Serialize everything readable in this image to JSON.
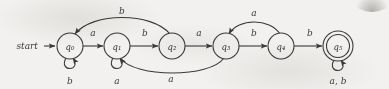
{
  "figure": {
    "kind": "finite-automaton-state-diagram",
    "start_label": "start",
    "stroke_color": "#3a3a3c",
    "background_color": "#f2f1ef"
  },
  "states": [
    {
      "id": "q0",
      "label": "q₀",
      "accepting": false,
      "start": true,
      "cx": 70,
      "cy": 46
    },
    {
      "id": "q1",
      "label": "q₁",
      "accepting": false,
      "start": false,
      "cx": 117,
      "cy": 46
    },
    {
      "id": "q2",
      "label": "q₂",
      "accepting": false,
      "start": false,
      "cx": 172,
      "cy": 46
    },
    {
      "id": "q3",
      "label": "q₃",
      "accepting": false,
      "start": false,
      "cx": 226,
      "cy": 46
    },
    {
      "id": "q4",
      "label": "q₄",
      "accepting": false,
      "start": false,
      "cx": 281,
      "cy": 46
    },
    {
      "id": "q5",
      "label": "q₅",
      "accepting": true,
      "start": false,
      "cx": 338,
      "cy": 46
    }
  ],
  "transitions": [
    {
      "id": "t-q0-q1",
      "from": "q0",
      "to": "q1",
      "symbol": "a",
      "shape": "straight",
      "label_x": 93,
      "label_y": 36
    },
    {
      "id": "t-q1-q2",
      "from": "q1",
      "to": "q2",
      "symbol": "b",
      "shape": "straight",
      "label_x": 145,
      "label_y": 36
    },
    {
      "id": "t-q2-q3",
      "from": "q2",
      "to": "q3",
      "symbol": "a",
      "shape": "straight",
      "label_x": 199,
      "label_y": 36
    },
    {
      "id": "t-q3-q4",
      "from": "q3",
      "to": "q4",
      "symbol": "b",
      "shape": "straight",
      "label_x": 254,
      "label_y": 36
    },
    {
      "id": "t-q4-q5",
      "from": "q4",
      "to": "q5",
      "symbol": "b",
      "shape": "straight",
      "label_x": 310,
      "label_y": 36
    },
    {
      "id": "t-q2-q0",
      "from": "q2",
      "to": "q0",
      "symbol": "b",
      "shape": "arc-above",
      "label_x": 122,
      "label_y": 14
    },
    {
      "id": "t-q4-q3",
      "from": "q4",
      "to": "q3",
      "symbol": "a",
      "shape": "arc-above",
      "label_x": 254,
      "label_y": 16
    },
    {
      "id": "t-q3-q1",
      "from": "q3",
      "to": "q1",
      "symbol": "a",
      "shape": "arc-below",
      "label_x": 171,
      "label_y": 82
    },
    {
      "id": "t-q0-q0",
      "from": "q0",
      "to": "q0",
      "symbol": "b",
      "shape": "self-loop",
      "label_x": 70,
      "label_y": 84
    },
    {
      "id": "t-q1-q1",
      "from": "q1",
      "to": "q1",
      "symbol": "a",
      "shape": "self-loop",
      "label_x": 117,
      "label_y": 84
    },
    {
      "id": "t-q5-q5",
      "from": "q5",
      "to": "q5",
      "symbol": "a, b",
      "shape": "self-loop",
      "label_x": 338,
      "label_y": 84
    }
  ]
}
